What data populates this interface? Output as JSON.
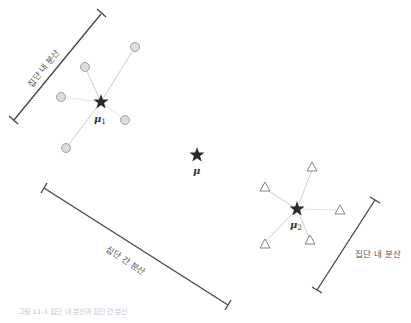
{
  "diagram": {
    "labels": {
      "within_left": "집단 내 분산",
      "within_right": "집단 내 분산",
      "between": "집단 간 분산"
    },
    "means": {
      "group1": {
        "symbol": "μ",
        "subscript": "1",
        "x": 101,
        "y": 102
      },
      "group2": {
        "symbol": "μ",
        "subscript": "2",
        "x": 297,
        "y": 209
      },
      "grand": {
        "symbol": "μ",
        "subscript": "",
        "x": 197,
        "y": 155
      }
    },
    "group1_points": {
      "marker": "circle",
      "points": [
        [
          135,
          47
        ],
        [
          85,
          67
        ],
        [
          61,
          97
        ],
        [
          125,
          120
        ],
        [
          66,
          148
        ]
      ]
    },
    "group2_points": {
      "marker": "triangle",
      "points": [
        [
          312,
          167
        ],
        [
          265,
          187
        ],
        [
          340,
          210
        ],
        [
          265,
          244
        ],
        [
          310,
          240
        ]
      ]
    },
    "bars": {
      "within_left": {
        "x1": 101,
        "y1": 14,
        "x2": 14,
        "y2": 120
      },
      "between": {
        "x1": 44,
        "y1": 188,
        "x2": 228,
        "y2": 305
      },
      "within_right": {
        "x1": 375,
        "y1": 200,
        "x2": 317,
        "y2": 290
      }
    },
    "caption": "그림 11-1 집단 내 분산과 집단 간 분산"
  }
}
